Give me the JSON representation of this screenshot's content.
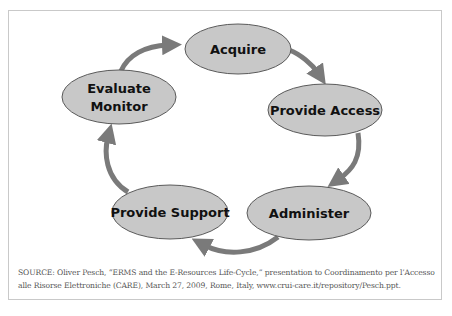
{
  "diagram": {
    "title": "E-Resources Life-Cycle",
    "type": "cycle",
    "nodes": [
      {
        "id": "acquire",
        "lines": [
          "Acquire"
        ],
        "cx": 238,
        "cy": 49,
        "rx": 53,
        "ry": 25
      },
      {
        "id": "provide-access",
        "lines": [
          "Provide Access"
        ],
        "cx": 325,
        "cy": 110,
        "rx": 57,
        "ry": 26
      },
      {
        "id": "administer",
        "lines": [
          "Administer"
        ],
        "cx": 309,
        "cy": 213,
        "rx": 62,
        "ry": 27
      },
      {
        "id": "provide-support",
        "lines": [
          "Provide Support"
        ],
        "cx": 170,
        "cy": 212,
        "rx": 58,
        "ry": 27
      },
      {
        "id": "evaluate-monitor",
        "lines": [
          "Evaluate",
          "Monitor"
        ],
        "cx": 119,
        "cy": 97,
        "rx": 57,
        "ry": 27
      }
    ],
    "edges": [
      {
        "from": "evaluate-monitor",
        "to": "acquire"
      },
      {
        "from": "acquire",
        "to": "provide-access"
      },
      {
        "from": "provide-access",
        "to": "administer"
      },
      {
        "from": "administer",
        "to": "provide-support"
      },
      {
        "from": "provide-support",
        "to": "evaluate-monitor"
      }
    ],
    "colors": {
      "node_fill": "#c8c8c8",
      "node_stroke": "#5a5a5a",
      "arrow": "#7a7a7a",
      "frame_border": "#c9c9c9",
      "text": "#111111",
      "source_text": "#555555"
    }
  },
  "source": {
    "line1": "SOURCE: Oliver Pesch, “ERMS and the E-Resources Life-Cycle,” presentation to Coordinamento per l’Accesso",
    "line2": "alle Risorse Elettroniche (CARE), March 27, 2009, Rome, Italy, www.crui-care.it/repository/Pesch.ppt."
  }
}
